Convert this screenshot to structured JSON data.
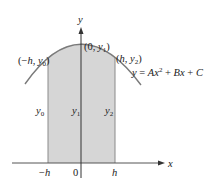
{
  "diagram": {
    "type": "parabola-simpson-rule",
    "colors": {
      "shade": "#d6d6d6",
      "curve": "#7a7a7a",
      "axis": "#333333",
      "edge": "#7a7a7a",
      "text": "#222222"
    },
    "axes": {
      "x_label": "x",
      "y_label": "y"
    },
    "points": [
      {
        "id": "left",
        "label_open": "(−",
        "label_h": "h",
        "label_sep": ", ",
        "label_y": "y",
        "label_sub": "0",
        "label_close": ")"
      },
      {
        "id": "center",
        "label_open": "(0, ",
        "label_y": "y",
        "label_sub": "1",
        "label_close": ")"
      },
      {
        "id": "right",
        "label_open": "(",
        "label_h": "h",
        "label_sep": ", ",
        "label_y": "y",
        "label_sub": "2",
        "label_close": ")"
      }
    ],
    "ordinates": [
      {
        "label_y": "y",
        "label_sub": "0"
      },
      {
        "label_y": "y",
        "label_sub": "1"
      },
      {
        "label_y": "y",
        "label_sub": "2"
      }
    ],
    "ticks": {
      "neg_h_minus": "−",
      "neg_h": "h",
      "zero": "0",
      "pos_h": "h"
    },
    "equation": {
      "y": "y",
      "eq": " = ",
      "A": "A",
      "x1": "x",
      "exp": "2",
      "plus1": " + ",
      "B": "B",
      "x2": "x",
      "plus2": " + ",
      "C": "C"
    }
  }
}
